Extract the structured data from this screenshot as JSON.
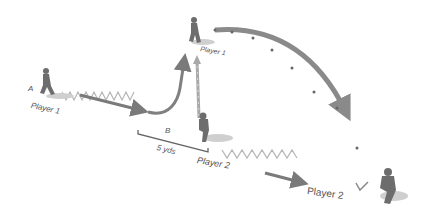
{
  "diagram": {
    "colors": {
      "arrow": "#7a7a7a",
      "ball_path": "#9a9a9a",
      "cones": "#b0b0b0",
      "figure": "#6d6d6d",
      "shadow": "#c8c8c8",
      "text": "#555555"
    },
    "labels": {
      "marker_a": "A",
      "marker_b": "B",
      "player1_start": "Player 1",
      "player1_top": "Player 1",
      "player2_mid": "Player 2",
      "player2_end": "Player 2",
      "distance": "5 yds"
    },
    "players": [
      {
        "name": "player-1-start",
        "x": 45,
        "y": 85
      },
      {
        "name": "player-1-top",
        "x": 192,
        "y": 30
      },
      {
        "name": "player-2-mid",
        "x": 205,
        "y": 130
      },
      {
        "name": "player-2-end",
        "x": 385,
        "y": 185
      }
    ]
  }
}
